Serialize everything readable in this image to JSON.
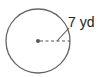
{
  "diagram": {
    "type": "circle",
    "radius_label": "7 yd",
    "colors": {
      "stroke": "#555555",
      "text": "#222222",
      "background": "#ffffff"
    }
  }
}
